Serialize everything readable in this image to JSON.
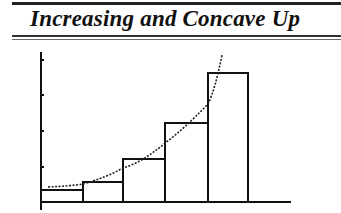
{
  "title": "Increasing and Concave Up",
  "diagram": {
    "rectangles": [
      {
        "x0": 41,
        "x1": 83,
        "top": 190
      },
      {
        "x0": 83,
        "x1": 123,
        "top": 182
      },
      {
        "x0": 123,
        "x1": 165,
        "top": 159
      },
      {
        "x0": 165,
        "x1": 208,
        "top": 123
      },
      {
        "x0": 208,
        "x1": 248,
        "top": 73
      }
    ],
    "curve_style": "dotted",
    "y_axis_ticks": 4
  }
}
